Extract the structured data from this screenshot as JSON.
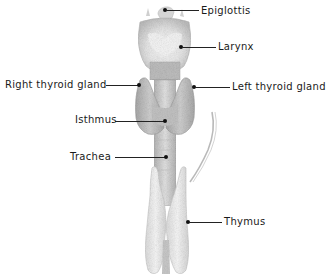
{
  "diagram": {
    "colors": {
      "background": "#ffffff",
      "epiglottis": "#d8d8d8",
      "larynx_cartilage": "#c9c9c9",
      "larynx_highlight": "#f2f2f2",
      "thyroid": "#bdbdbd",
      "trachea": "#cfcfcf",
      "thymus": "#ececec",
      "text": "#1a1a1a",
      "leader_line": "#222222"
    },
    "labels": [
      {
        "id": "epiglottis",
        "text": "Epiglottis",
        "side": "right",
        "label_x": 201,
        "label_y": 5,
        "dot_x": 165,
        "dot_y": 10
      },
      {
        "id": "larynx",
        "text": "Larynx",
        "side": "right",
        "label_x": 218,
        "label_y": 41,
        "dot_x": 181,
        "dot_y": 47
      },
      {
        "id": "right-thyroid-gland",
        "text": "Right thyroid gland",
        "side": "left",
        "label_x": 5,
        "label_y": 79,
        "dot_x": 139,
        "dot_y": 85
      },
      {
        "id": "left-thyroid-gland",
        "text": "Left thyroid gland",
        "side": "right",
        "label_x": 232,
        "label_y": 81,
        "dot_x": 194,
        "dot_y": 87
      },
      {
        "id": "isthmus",
        "text": "Isthmus",
        "side": "left",
        "label_x": 75,
        "label_y": 114,
        "dot_x": 165,
        "dot_y": 121
      },
      {
        "id": "trachea",
        "text": "Trachea",
        "side": "left",
        "label_x": 70,
        "label_y": 151,
        "dot_x": 166,
        "dot_y": 157
      },
      {
        "id": "thymus",
        "text": "Thymus",
        "side": "right",
        "label_x": 224,
        "label_y": 216,
        "dot_x": 188,
        "dot_y": 222
      }
    ]
  }
}
